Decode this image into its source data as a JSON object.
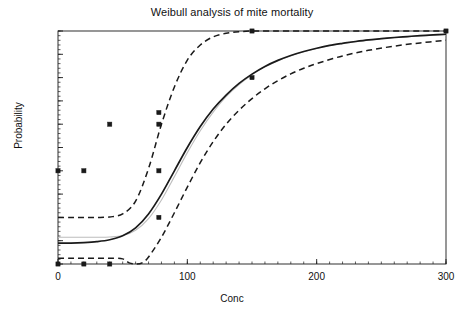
{
  "chart_data": {
    "type": "scatter",
    "title": "Weibull analysis of mite mortality",
    "xlabel": "Conc",
    "ylabel": "Probability",
    "xlim": [
      0,
      300
    ],
    "ylim": [
      0.0,
      1.0
    ],
    "grid": false,
    "legend": "none",
    "x_major_ticks": [
      0,
      100,
      200,
      300
    ],
    "x_major_tick_labels": [
      "0",
      "100",
      "200",
      "300"
    ],
    "x_minor_tick_step": 10,
    "y_major_ticks": [
      0.0,
      0.1,
      0.2,
      0.3,
      0.4,
      0.5,
      0.6,
      0.7,
      0.8,
      0.9,
      1.0
    ],
    "y_major_tick_labels": [
      "0.0",
      "0.1",
      "0.2",
      "0.3",
      "0.4",
      "0.5",
      "0.6",
      "0.7",
      "0.8",
      "0.9",
      "1.0"
    ],
    "points": {
      "name": "Observed mortality",
      "marker": "filled-square",
      "color": "#1a1a1a",
      "x": [
        0,
        0,
        20,
        20,
        40,
        40,
        78,
        78,
        78,
        78,
        150,
        150,
        300
      ],
      "y": [
        0.0,
        0.4,
        0.0,
        0.4,
        0.0,
        0.6,
        0.2,
        0.4,
        0.6,
        0.65,
        0.8,
        1.0,
        1.0
      ]
    },
    "series": [
      {
        "name": "Fitted Weibull curve",
        "style": "solid",
        "color": "#1a1a1a",
        "x": [
          0,
          10,
          20,
          30,
          40,
          50,
          60,
          70,
          80,
          90,
          100,
          110,
          120,
          130,
          140,
          150,
          160,
          170,
          180,
          190,
          200,
          210,
          220,
          230,
          240,
          250,
          260,
          270,
          280,
          290,
          300
        ],
        "y": [
          0.09,
          0.09,
          0.092,
          0.096,
          0.104,
          0.121,
          0.155,
          0.215,
          0.3,
          0.4,
          0.5,
          0.59,
          0.665,
          0.725,
          0.775,
          0.815,
          0.848,
          0.874,
          0.895,
          0.912,
          0.926,
          0.938,
          0.947,
          0.955,
          0.962,
          0.967,
          0.972,
          0.976,
          0.98,
          0.983,
          0.986
        ]
      },
      {
        "name": "Upper confidence limit",
        "style": "dashed",
        "color": "#1a1a1a",
        "x": [
          0,
          10,
          20,
          30,
          40,
          50,
          60,
          70,
          80,
          90,
          100,
          110,
          120,
          130,
          140,
          150,
          160,
          200,
          250,
          300
        ],
        "y": [
          0.2,
          0.2,
          0.2,
          0.2,
          0.202,
          0.215,
          0.27,
          0.41,
          0.6,
          0.76,
          0.875,
          0.94,
          0.975,
          0.99,
          0.997,
          1.0,
          1.0,
          1.0,
          1.0,
          1.0
        ]
      },
      {
        "name": "Lower confidence limit",
        "style": "dashed",
        "color": "#1a1a1a",
        "x": [
          0,
          10,
          20,
          30,
          40,
          50,
          55,
          60,
          65,
          70,
          80,
          90,
          100,
          110,
          120,
          130,
          140,
          150,
          160,
          170,
          180,
          190,
          200,
          220,
          240,
          260,
          280,
          300
        ],
        "y": [
          0.025,
          0.025,
          0.025,
          0.025,
          0.025,
          0.022,
          0.005,
          0.0,
          0.005,
          0.03,
          0.115,
          0.22,
          0.33,
          0.435,
          0.525,
          0.6,
          0.66,
          0.71,
          0.752,
          0.787,
          0.816,
          0.84,
          0.86,
          0.893,
          0.917,
          0.935,
          0.949,
          0.96
        ]
      },
      {
        "name": "Reference curve",
        "style": "solid-light",
        "color": "#bdbdbd",
        "x": [
          0,
          10,
          20,
          30,
          40,
          50,
          60,
          70,
          80,
          90,
          100,
          110,
          120,
          130,
          140,
          150,
          160,
          180,
          200,
          220,
          240,
          260,
          280,
          300
        ],
        "y": [
          0.115,
          0.115,
          0.115,
          0.115,
          0.116,
          0.122,
          0.145,
          0.195,
          0.275,
          0.375,
          0.478,
          0.572,
          0.652,
          0.718,
          0.77,
          0.812,
          0.846,
          0.894,
          0.925,
          0.946,
          0.961,
          0.971,
          0.979,
          0.984
        ]
      }
    ]
  }
}
